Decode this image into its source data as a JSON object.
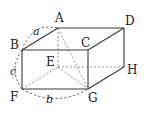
{
  "figure": {
    "type": "rectangular cuboid with space diagonal",
    "vertices": {
      "A": {
        "label": "A",
        "x": 58,
        "y": 28
      },
      "B": {
        "label": "B",
        "x": 22,
        "y": 50
      },
      "C": {
        "label": "C",
        "x": 88,
        "y": 50
      },
      "D": {
        "label": "D",
        "x": 124,
        "y": 28
      },
      "E": {
        "label": "E",
        "x": 58,
        "y": 67
      },
      "F": {
        "label": "F",
        "x": 22,
        "y": 89
      },
      "G": {
        "label": "G",
        "x": 88,
        "y": 89
      },
      "H": {
        "label": "H",
        "x": 124,
        "y": 67
      }
    },
    "solid_edges": [
      "AB",
      "AD",
      "BC",
      "CD",
      "BF",
      "CG",
      "FG",
      "DH",
      "GH"
    ],
    "hidden_edges": [
      "AE",
      "EF",
      "EH",
      "EG",
      "AG"
    ],
    "dimensions": {
      "a": {
        "label": "a",
        "between": "A-B"
      },
      "b": {
        "label": "b",
        "between": "F-G"
      },
      "c": {
        "label": "c",
        "between": "B-F"
      }
    }
  }
}
